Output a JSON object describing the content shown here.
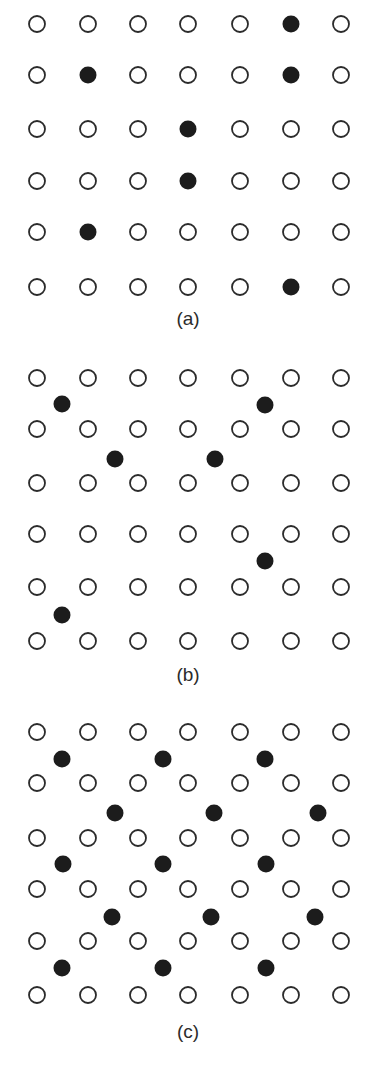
{
  "figure": {
    "colors": {
      "background": "#ffffff",
      "open_stroke": "#2b2b2b",
      "filled": "#1c1c1c",
      "label": "#2b2b2b"
    },
    "open_radius": 8,
    "filled_radius": 8.5,
    "columns_x": [
      37,
      88,
      138,
      188,
      240,
      291,
      341
    ]
  },
  "panels": [
    {
      "id": "a",
      "label": "(a)",
      "label_y": 308,
      "rows_y": [
        24,
        75,
        129,
        181,
        232,
        287
      ],
      "substitutional_filled": [
        {
          "row": 0,
          "col": 5
        },
        {
          "row": 1,
          "col": 1
        },
        {
          "row": 1,
          "col": 5
        },
        {
          "row": 2,
          "col": 3
        },
        {
          "row": 3,
          "col": 3
        },
        {
          "row": 4,
          "col": 1
        },
        {
          "row": 5,
          "col": 5
        }
      ],
      "interstitial_filled": []
    },
    {
      "id": "b",
      "label": "(b)",
      "label_y": 664,
      "rows_y": [
        378,
        429,
        483,
        534,
        587,
        641
      ],
      "substitutional_filled": [],
      "interstitial_filled": [
        {
          "x": 62,
          "y": 404
        },
        {
          "x": 265,
          "y": 405
        },
        {
          "x": 115,
          "y": 459
        },
        {
          "x": 215,
          "y": 459
        },
        {
          "x": 265,
          "y": 561
        },
        {
          "x": 62,
          "y": 615
        }
      ]
    },
    {
      "id": "c",
      "label": "(c)",
      "label_y": 1021,
      "rows_y": [
        732,
        783,
        838,
        889,
        941,
        995
      ],
      "substitutional_filled": [],
      "interstitial_filled": [
        {
          "x": 62,
          "y": 759
        },
        {
          "x": 163,
          "y": 759
        },
        {
          "x": 265,
          "y": 759
        },
        {
          "x": 115,
          "y": 813
        },
        {
          "x": 214,
          "y": 813
        },
        {
          "x": 318,
          "y": 813
        },
        {
          "x": 63,
          "y": 864
        },
        {
          "x": 163,
          "y": 864
        },
        {
          "x": 266,
          "y": 864
        },
        {
          "x": 112,
          "y": 917
        },
        {
          "x": 211,
          "y": 917
        },
        {
          "x": 315,
          "y": 917
        },
        {
          "x": 62,
          "y": 968
        },
        {
          "x": 163,
          "y": 968
        },
        {
          "x": 266,
          "y": 968
        }
      ]
    }
  ]
}
